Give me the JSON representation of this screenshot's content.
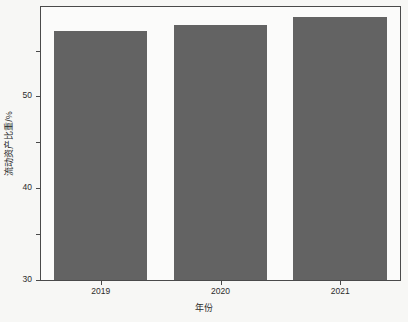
{
  "chart_data": {
    "type": "bar",
    "title": "",
    "subtitle": "",
    "categories": [
      "2019",
      "2020",
      "2021"
    ],
    "values": [
      54.3,
      55.6,
      57.4
    ],
    "series": [
      {
        "name": "流动资产比重",
        "values": [
          54.3,
          55.6,
          57.4
        ]
      }
    ],
    "xlabel": "年份",
    "ylabel": "流动资产比重/%",
    "ylim": [
      0,
      59.5
    ],
    "xlim": [
      0,
      3
    ],
    "yticks": [
      0,
      10,
      20,
      30,
      40,
      50
    ],
    "ytick_labels": [
      "0",
      "10",
      "20",
      "30",
      "40",
      "50"
    ],
    "xtick_labels": [
      "2019",
      "2020",
      "2021"
    ],
    "grid": false,
    "legend": null,
    "legend_position": "none",
    "annotations": [],
    "bar_color": "#636363",
    "frame_color": "#4a4a4a",
    "background_color": "#f7f7f5",
    "plot_background_color": "#fbfbfa",
    "bar_width_fraction": 0.78
  }
}
